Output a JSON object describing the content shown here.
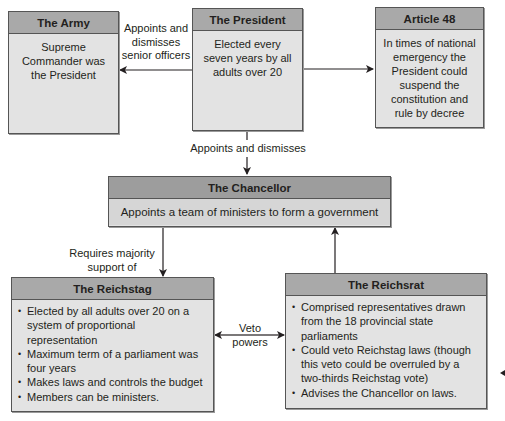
{
  "diagram": {
    "colors": {
      "header_fill": "#a9a9a9",
      "body_fill": "#e3e3e3",
      "border": "#555555",
      "text": "#231f20"
    },
    "nodes": {
      "army": {
        "title": "The Army",
        "body": "Supreme Commander was the President"
      },
      "president": {
        "title": "The President",
        "body": "Elected every seven years by all adults over 20"
      },
      "article48": {
        "title": "Article 48",
        "body": "In times of national emergency the President could suspend the constitution and rule by decree"
      },
      "chancellor": {
        "title": "The Chancellor",
        "body": "Appoints a team of ministers to form a government"
      },
      "reichstag": {
        "title": "The Reichstag",
        "bullets": [
          "Elected by all adults over 20 on a system of proportional representation",
          "Maximum term of a parliament was four years",
          "Makes laws and controls the budget",
          "Members can be ministers."
        ]
      },
      "reichsrat": {
        "title": "The Reichsrat",
        "bullets": [
          "Comprised representatives drawn from the 18 provincial state parliaments",
          "Could veto Reichstag laws (though this veto could be overruled by a two-thirds Reichstag vote)",
          "Advises the Chancellor on laws."
        ]
      }
    },
    "edges": {
      "president_to_army": "Appoints and dismisses senior officers",
      "president_to_article48": "",
      "president_to_chancellor": "Appoints and dismisses",
      "chancellor_to_reichstag": "Requires majority support of",
      "reichsrat_reichstag": "Veto powers",
      "reichsrat_to_chancellor": ""
    }
  }
}
